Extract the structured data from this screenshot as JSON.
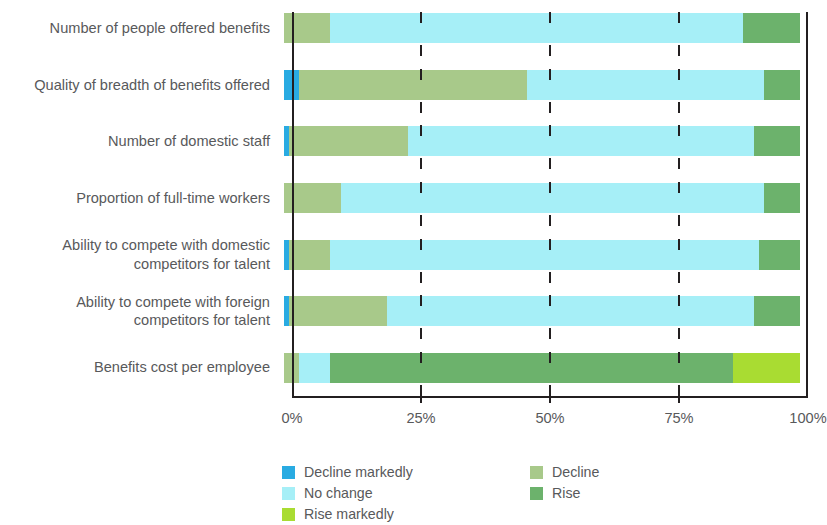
{
  "chart_data": {
    "type": "bar",
    "orientation": "horizontal",
    "stacked": true,
    "normalized_percent": true,
    "title": "",
    "subtitle": "",
    "xlabel": "",
    "ylabel": "",
    "xlim": [
      0,
      100
    ],
    "xticks": [
      0,
      25,
      50,
      75,
      100
    ],
    "xtick_labels": [
      "0%",
      "25%",
      "50%",
      "75%",
      "100%"
    ],
    "grid": true,
    "grid_style": "dashed-vertical",
    "legend_position": "bottom",
    "categories": [
      "Number of people offered benefits",
      "Quality of breadth of benefits offered",
      "Number of domestic staff",
      "Proportion of full-time workers",
      "Ability to compete with domestic\ncompetitors for talent",
      "Ability to compete with foreign\ncompetitors for talent",
      "Benefits cost per employee"
    ],
    "series": [
      {
        "name": "Decline markedly",
        "color": "#29abe2",
        "values": [
          0,
          3,
          1,
          0,
          1,
          1,
          0
        ]
      },
      {
        "name": "Decline",
        "color": "#a8c98a",
        "values": [
          9,
          44,
          23,
          11,
          8,
          19,
          3
        ]
      },
      {
        "name": "No change",
        "color": "#a6eff7",
        "values": [
          80,
          46,
          67,
          82,
          83,
          71,
          6
        ]
      },
      {
        "name": "Rise",
        "color": "#6cb26c",
        "values": [
          11,
          7,
          9,
          7,
          8,
          9,
          78
        ]
      },
      {
        "name": "Rise markedly",
        "color": "#a9dc32",
        "values": [
          0,
          0,
          0,
          0,
          0,
          0,
          13
        ]
      }
    ]
  },
  "axis": {
    "tick_labels": [
      "0%",
      "25%",
      "50%",
      "75%",
      "100%"
    ]
  },
  "legend": {
    "columns": [
      {
        "items": [
          {
            "label": "Decline markedly",
            "color": "#29abe2"
          },
          {
            "label": "No change",
            "color": "#a6eff7"
          },
          {
            "label": "Rise markedly",
            "color": "#a9dc32"
          }
        ]
      },
      {
        "items": [
          {
            "label": "Decline",
            "color": "#a8c98a"
          },
          {
            "label": "Rise",
            "color": "#6cb26c"
          }
        ]
      }
    ]
  }
}
